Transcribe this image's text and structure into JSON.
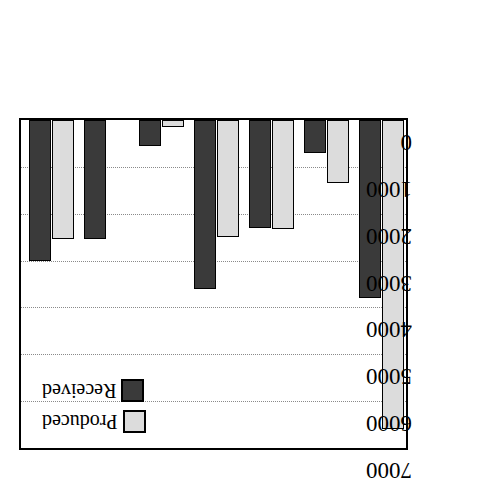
{
  "chart_data": {
    "type": "bar",
    "title": "",
    "subtitle": "",
    "xlabel": "",
    "ylabel": "",
    "ylim": [
      0,
      7000
    ],
    "y_axis_inverted": true,
    "grid": true,
    "legend_position": "bottom-left",
    "y_ticks": [
      "0",
      "1000",
      "2000",
      "3000",
      "4000",
      "5000",
      "6000",
      "7000"
    ],
    "y_tick_values": [
      0,
      1000,
      2000,
      3000,
      4000,
      5000,
      6000,
      7000
    ],
    "categories": [
      "Europe",
      "Other",
      "Scand.",
      "Soviet Union",
      "Fr, It, WG",
      "UK",
      "E.Europe"
    ],
    "category_label_lines": [
      [
        "Europe"
      ],
      [
        "Other"
      ],
      [
        "Scand."
      ],
      [
        "Soviet",
        "Union"
      ],
      [
        "Fr, It, WG"
      ],
      [
        "UK"
      ],
      [
        "E.Europe"
      ]
    ],
    "series": [
      {
        "name": "Received",
        "color": "#3a3a3a",
        "values": [
          3000,
          2550,
          550,
          3600,
          2300,
          700,
          3800
        ]
      },
      {
        "name": "Produced",
        "color": "#dcdcdc",
        "values": [
          2550,
          0,
          150,
          2500,
          2320,
          1350,
          6600
        ]
      }
    ]
  },
  "legend": {
    "items": [
      {
        "label": "Received",
        "series": "Received"
      },
      {
        "label": "Produced",
        "series": "Produced"
      }
    ]
  }
}
